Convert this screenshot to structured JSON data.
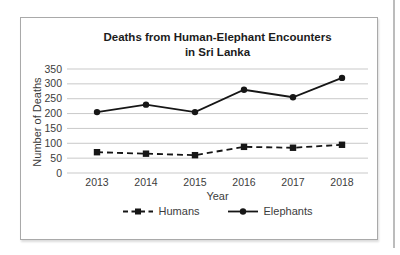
{
  "page": {
    "background_color": "#ffffff",
    "frame_border_color": "#a9a9a9",
    "page_edge_line_color": "#bcbcbc"
  },
  "chart_data": {
    "type": "line",
    "title": "Deaths from Human-Elephant Encounters in Sri Lanka",
    "title_lines": [
      "Deaths from Human-Elephant Encounters",
      "in Sri Lanka"
    ],
    "xlabel": "Year",
    "ylabel": "Number of Deaths",
    "categories": [
      "2013",
      "2014",
      "2015",
      "2016",
      "2017",
      "2018"
    ],
    "series": [
      {
        "name": "Humans",
        "values": [
          70,
          65,
          60,
          88,
          85,
          95
        ],
        "line_style": "dashed",
        "marker": "square"
      },
      {
        "name": "Elephants",
        "values": [
          205,
          230,
          205,
          280,
          255,
          320
        ],
        "line_style": "solid",
        "marker": "circle"
      }
    ],
    "ylim": [
      0,
      350
    ],
    "yticks": [
      0,
      50,
      100,
      150,
      200,
      250,
      300,
      350
    ],
    "grid": true,
    "legend_position": "bottom",
    "line_color": "#161616",
    "grid_color": "#c9c9c9",
    "tick_label_color": "#3c3c3c"
  }
}
